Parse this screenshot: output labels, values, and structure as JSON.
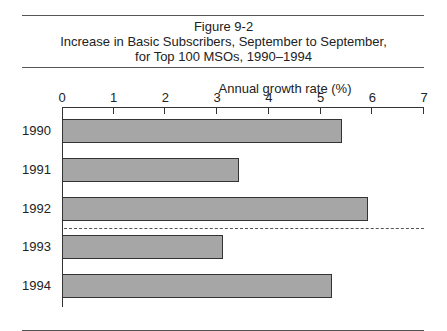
{
  "figure": {
    "number": "Figure 9-2",
    "title_line1": "Increase in Basic Subscribers, September to September,",
    "title_line2": "for Top 100 MSOs, 1990–1994"
  },
  "chart_data": {
    "type": "bar",
    "orientation": "horizontal",
    "xlabel": "Annual growth rate (%)",
    "ylabel": "",
    "categories": [
      "1990",
      "1991",
      "1992",
      "1993",
      "1994"
    ],
    "values": [
      5.4,
      3.4,
      5.9,
      3.1,
      5.2
    ],
    "xlim": [
      0,
      7
    ],
    "x_ticks": [
      "0",
      "1",
      "2",
      "3",
      "4",
      "5",
      "6",
      "7"
    ],
    "grid": false,
    "legend": null,
    "annotations": [
      "dashed horizontal separator between 1992 and 1993"
    ],
    "bar_color": "#a6a6a6"
  }
}
